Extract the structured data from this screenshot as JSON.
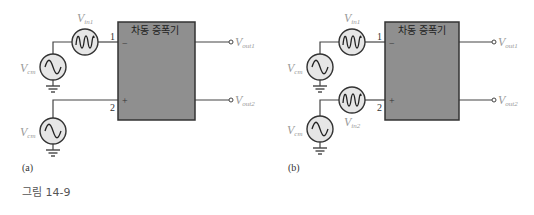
{
  "figure": {
    "caption": "그림 14-9"
  },
  "panels": [
    {
      "id": "a",
      "label": "(a)",
      "amplifier_title": "차동 증폭기",
      "pin1": "1",
      "pin2": "2",
      "pin1_sign": "−",
      "pin2_sign": "+",
      "sources": {
        "vin1": {
          "main": "V",
          "sub": "in1"
        },
        "vcm_top": {
          "main": "V",
          "sub": "cm"
        },
        "vcm_bottom": {
          "main": "V",
          "sub": "cm"
        }
      },
      "outputs": {
        "out1": {
          "main": "V",
          "sub": "out1"
        },
        "out2": {
          "main": "V",
          "sub": "out2"
        }
      }
    },
    {
      "id": "b",
      "label": "(b)",
      "amplifier_title": "차동 증폭기",
      "pin1": "1",
      "pin2": "2",
      "pin1_sign": "−",
      "pin2_sign": "+",
      "sources": {
        "vin1": {
          "main": "V",
          "sub": "in1"
        },
        "vin2": {
          "main": "V",
          "sub": "in2"
        },
        "vcm_top": {
          "main": "V",
          "sub": "cm"
        },
        "vcm_bottom": {
          "main": "V",
          "sub": "cm"
        }
      },
      "outputs": {
        "out1": {
          "main": "V",
          "sub": "out1"
        },
        "out2": {
          "main": "V",
          "sub": "out2"
        }
      }
    }
  ],
  "colors": {
    "amplifier_fill": "#8f8f8f",
    "source_fill": "#e6e6e6",
    "wire": "#444444",
    "label": "#9a9a9a"
  }
}
